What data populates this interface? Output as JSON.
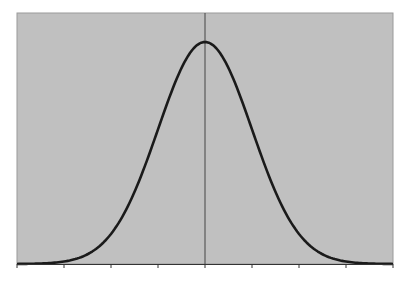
{
  "chart_data": {
    "type": "line",
    "title": "",
    "xlabel": "",
    "ylabel": "",
    "xlim": [
      -4,
      4
    ],
    "ylim": [
      0,
      0.45
    ],
    "x_ticks": [
      -4,
      -3,
      -2,
      -1,
      0,
      1,
      2,
      3,
      4
    ],
    "tick_labels_visible": false,
    "grid": false,
    "legend": null,
    "center_line_x": 0,
    "series": [
      {
        "name": "normal-pdf",
        "x": [
          -4,
          -3.5,
          -3,
          -2.5,
          -2,
          -1.5,
          -1,
          -0.5,
          0,
          0.5,
          1,
          1.5,
          2,
          2.5,
          3,
          3.5,
          4
        ],
        "values": [
          0.0001,
          0.0009,
          0.0044,
          0.0175,
          0.054,
          0.1295,
          0.242,
          0.3521,
          0.3989,
          0.3521,
          0.242,
          0.1295,
          0.054,
          0.0175,
          0.0044,
          0.0009,
          0.0001
        ]
      }
    ],
    "colors": {
      "plot_background": "#c0c0c0",
      "curve": "#1a1a1a",
      "axis": "#333333",
      "center_line": "#444444",
      "border": "#9a9a9a"
    }
  }
}
